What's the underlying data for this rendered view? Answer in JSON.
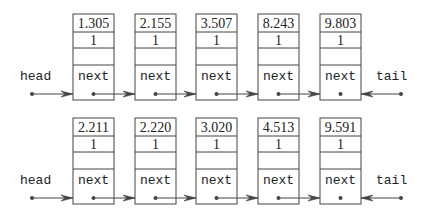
{
  "lists": [
    {
      "head_label": "head",
      "tail_label": "tail",
      "nodes": [
        {
          "value": "1.305",
          "count": "1",
          "next_label": "next"
        },
        {
          "value": "2.155",
          "count": "1",
          "next_label": "next"
        },
        {
          "value": "3.507",
          "count": "1",
          "next_label": "next"
        },
        {
          "value": "8.243",
          "count": "1",
          "next_label": "next"
        },
        {
          "value": "9.803",
          "count": "1",
          "next_label": "next"
        }
      ]
    },
    {
      "head_label": "head",
      "tail_label": "tail",
      "nodes": [
        {
          "value": "2.211",
          "count": "1",
          "next_label": "next"
        },
        {
          "value": "2.220",
          "count": "1",
          "next_label": "next"
        },
        {
          "value": "3.020",
          "count": "1",
          "next_label": "next"
        },
        {
          "value": "4.513",
          "count": "1",
          "next_label": "next"
        },
        {
          "value": "9.591",
          "count": "1",
          "next_label": "next"
        }
      ]
    }
  ],
  "colors": {
    "stroke": "#444444",
    "text": "#222222",
    "background": "#ffffff"
  }
}
